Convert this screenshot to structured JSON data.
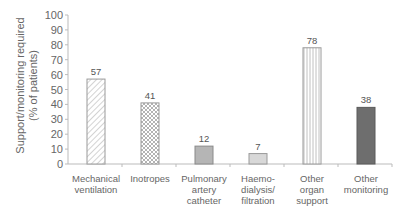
{
  "chart_data": {
    "type": "bar",
    "title": "",
    "xlabel": "",
    "ylabel": "Support/monitoring required (% of patients)",
    "ylabel_lines": [
      "Support/monitoring required",
      "(% of patients)"
    ],
    "ylim": [
      0,
      100
    ],
    "yticks": [
      0,
      10,
      20,
      30,
      40,
      50,
      60,
      70,
      80,
      90,
      100
    ],
    "grid": false,
    "legend": null,
    "categories": [
      "Mechanical ventilation",
      "Inotropes",
      "Pulmonary artery catheter",
      "Haemodialysis/filtration",
      "Other organ support",
      "Other monitoring"
    ],
    "category_label_lines": [
      [
        "Mechanical",
        "ventilation"
      ],
      [
        "Inotropes"
      ],
      [
        "Pulmonary",
        "artery",
        "catheter"
      ],
      [
        "Haemo-",
        "dialysis/",
        "filtration"
      ],
      [
        "Other",
        "organ",
        "support"
      ],
      [
        "Other",
        "monitoring"
      ]
    ],
    "values": [
      57,
      41,
      12,
      7,
      78,
      38
    ],
    "data_labels": [
      "57",
      "41",
      "12",
      "7",
      "78",
      "38"
    ],
    "bar_styles": [
      {
        "pattern": "diagonal-hatch",
        "fill": "#ffffff",
        "stroke": "#9a9a9a"
      },
      {
        "pattern": "crosshatch",
        "fill": "#ffffff",
        "stroke": "#9a9a9a"
      },
      {
        "pattern": "solid",
        "fill": "#b5b5b5",
        "stroke": "#8a8a8a"
      },
      {
        "pattern": "solid",
        "fill": "#d8d8d8",
        "stroke": "#9a9a9a"
      },
      {
        "pattern": "vertical-lines",
        "fill": "#ffffff",
        "stroke": "#9a9a9a"
      },
      {
        "pattern": "solid",
        "fill": "#6e6e6e",
        "stroke": "#5a5a5a"
      }
    ]
  }
}
